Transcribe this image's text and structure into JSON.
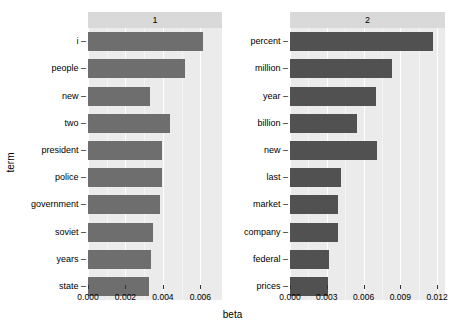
{
  "chart_data": {
    "type": "bar",
    "orientation": "horizontal",
    "title": "",
    "xlabel": "beta",
    "ylabel": "term",
    "grid": true,
    "legend": false,
    "facets": [
      {
        "strip_label": "1",
        "xlim": [
          0,
          0.00715
        ],
        "xticks": [
          0.0,
          0.002,
          0.004,
          0.006
        ],
        "xticklabels": [
          "0.000",
          "0.002",
          "0.004",
          "0.006"
        ],
        "categories": [
          "i",
          "people",
          "new",
          "two",
          "president",
          "police",
          "government",
          "soviet",
          "years",
          "state"
        ],
        "values": [
          0.00615,
          0.00516,
          0.00332,
          0.00439,
          0.00396,
          0.00396,
          0.00385,
          0.00346,
          0.00337,
          0.00327
        ]
      },
      {
        "strip_label": "2",
        "xlim": [
          0,
          0.01265
        ],
        "xticks": [
          0.0,
          0.003,
          0.006,
          0.009,
          0.012
        ],
        "xticklabels": [
          "0.000",
          "0.003",
          "0.006",
          "0.009",
          "0.012"
        ],
        "categories": [
          "percent",
          "million",
          "year",
          "billion",
          "new",
          "last",
          "market",
          "company",
          "federal",
          "prices"
        ],
        "values": [
          0.0117,
          0.00835,
          0.00703,
          0.00548,
          0.00712,
          0.00417,
          0.00393,
          0.00393,
          0.00319,
          0.00311
        ]
      }
    ],
    "colors": {
      "bar_facet_1": "#6e6e6e",
      "bar_facet_2": "#515151",
      "panel_background": "#ebebeb",
      "strip_background": "#d9d9d9",
      "gridline": "#ffffff",
      "text": "#000000"
    }
  }
}
